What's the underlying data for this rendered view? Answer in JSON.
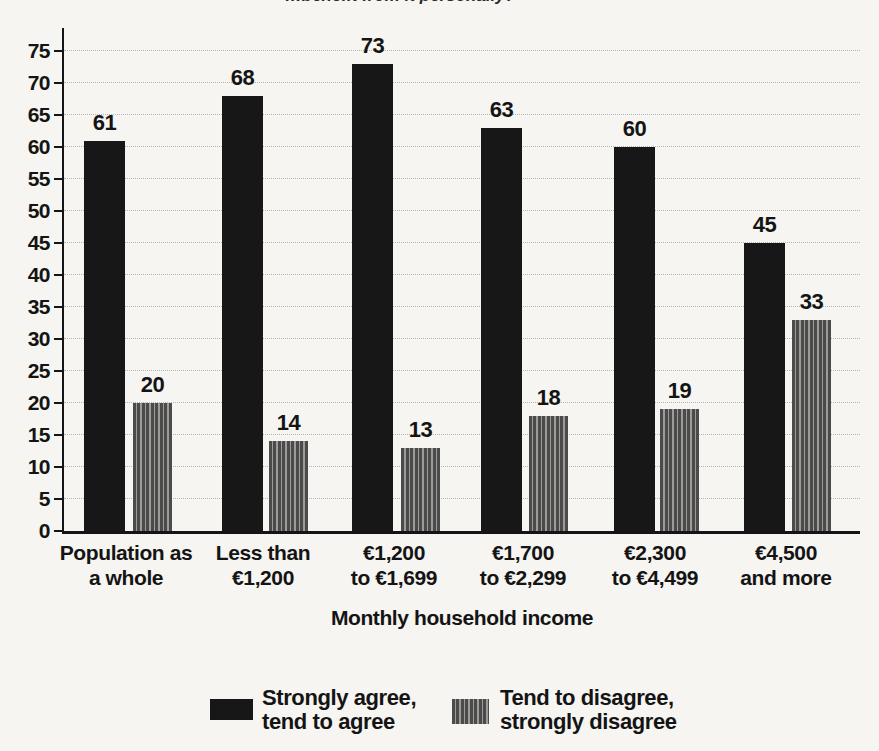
{
  "title_fragment": "…benefit from it personally?",
  "chart_data": {
    "type": "bar",
    "title": "",
    "xlabel": "Monthly household income",
    "ylabel": "",
    "ylim": [
      0,
      75
    ],
    "ytick_step": 5,
    "grid": "dotted-horizontal",
    "legend_position": "bottom",
    "categories_lines": [
      [
        "Population as",
        "a whole"
      ],
      [
        "Less than",
        "€1,200"
      ],
      [
        "€1,200",
        "to €1,699"
      ],
      [
        "€1,700",
        "to €2,299"
      ],
      [
        "€2,300",
        "to €4,499"
      ],
      [
        "€4,500",
        "and more"
      ]
    ],
    "series": [
      {
        "name": "Strongly agree, tend to agree",
        "style": "solid-black",
        "values": [
          61,
          68,
          73,
          63,
          60,
          45
        ]
      },
      {
        "name": "Tend to disagree, strongly disagree",
        "style": "striped-gray",
        "values": [
          20,
          14,
          13,
          18,
          19,
          33
        ]
      }
    ]
  },
  "legend": {
    "items": [
      {
        "line1": "Strongly agree,",
        "line2": "tend to agree",
        "swatch": "solid-black"
      },
      {
        "line1": "Tend to disagree,",
        "line2": "strongly disagree",
        "swatch": "striped-gray"
      }
    ]
  },
  "colors": {
    "bar_black": "#171717",
    "stripe_dark": "#4b4b4b",
    "stripe_light": "#9e9c98",
    "grid": "#b8b5ae",
    "axis": "#141414",
    "background": "#f6f5f1"
  }
}
